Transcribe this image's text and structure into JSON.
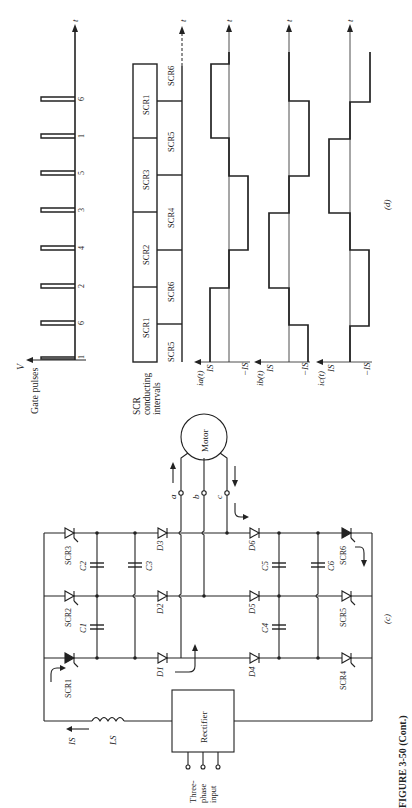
{
  "figure": {
    "caption": "FIGURE 3-50 (Cont.)",
    "panel_c_label": "(c)",
    "panel_d_label": "(d)"
  },
  "timing": {
    "axis_label_t": "t",
    "gate_pulses": {
      "axis_label": "V",
      "title": "Gate pulses",
      "sequence": [
        "1",
        "6",
        "2",
        "4",
        "3",
        "5",
        "1",
        "6"
      ]
    },
    "conducting": {
      "title_line1": "SCR",
      "title_line2": "conducting",
      "title_line3": "intervals",
      "upper_row": [
        "SCR1",
        "SCR2",
        "SCR3",
        "SCR1"
      ],
      "lower_row": [
        "SCR5",
        "SCR6",
        "SCR4",
        "SCR5",
        "SCR6"
      ]
    },
    "currents": [
      {
        "name": "ia(t)",
        "pos_label": "IS",
        "neg_label": "−IS",
        "levels": [
          1,
          0,
          -1,
          0,
          1,
          0
        ]
      },
      {
        "name": "ib(t)",
        "pos_label": "IS",
        "neg_label": "−IS",
        "levels": [
          -1,
          0,
          1,
          0,
          -1,
          0
        ]
      },
      {
        "name": "ic(t)",
        "pos_label": "IS",
        "neg_label": "−IS",
        "levels": [
          0,
          -1,
          0,
          1,
          0,
          -1
        ]
      }
    ]
  },
  "circuit": {
    "motor_label": "Motor",
    "terminals": [
      "a",
      "b",
      "c"
    ],
    "rectifier_label": "Rectifier",
    "input_line1": "Three-",
    "input_line2": "phase",
    "input_line3": "input",
    "inductor_label": "LS",
    "current_label": "IS",
    "scrs": [
      "SCR1",
      "SCR2",
      "SCR3",
      "SCR4",
      "SCR5",
      "SCR6"
    ],
    "diodes": [
      "D1",
      "D2",
      "D3",
      "D4",
      "D5",
      "D6"
    ],
    "capacitors": [
      "C1",
      "C2",
      "C3",
      "C4",
      "C5",
      "C6"
    ]
  }
}
